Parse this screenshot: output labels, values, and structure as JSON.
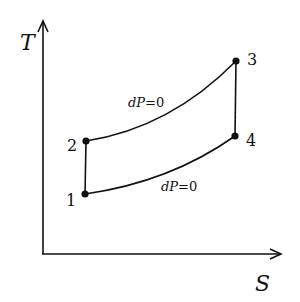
{
  "diagram": {
    "axes": {
      "y_label": "T",
      "x_label": "S"
    },
    "points": [
      {
        "id": "1",
        "label": "1",
        "x": 85,
        "y": 194
      },
      {
        "id": "2",
        "label": "2",
        "x": 86,
        "y": 141
      },
      {
        "id": "3",
        "label": "3",
        "x": 236,
        "y": 61
      },
      {
        "id": "4",
        "label": "4",
        "x": 235,
        "y": 136
      }
    ],
    "processes": {
      "upper": {
        "from": "2",
        "to": "3",
        "label_var": "dP",
        "label_eq": "=0"
      },
      "lower": {
        "from": "1",
        "to": "4",
        "label_var": "dP",
        "label_eq": "=0"
      },
      "left": {
        "from": "1",
        "to": "2"
      },
      "right": {
        "from": "3",
        "to": "4"
      }
    },
    "colors": {
      "ink": "#111111",
      "background": "#ffffff"
    }
  }
}
